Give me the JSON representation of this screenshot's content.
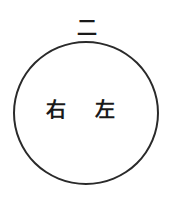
{
  "diagram": {
    "top_label": "二",
    "circle": {
      "stroke_color": "#2a2a2a"
    },
    "inner_labels": [
      {
        "text": "右",
        "position": "left"
      },
      {
        "text": "左",
        "position": "right"
      }
    ]
  }
}
